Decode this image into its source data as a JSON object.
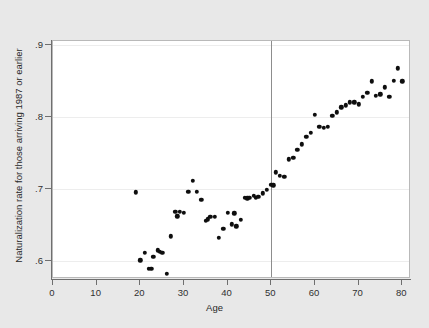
{
  "chart_data": {
    "type": "scatter",
    "title": "",
    "xlabel": "Age",
    "ylabel": "Naturalization rate for those arriving 1987 or earlier",
    "xlim": [
      0,
      82
    ],
    "ylim": [
      0.575,
      0.905
    ],
    "xticks": [
      0,
      10,
      20,
      30,
      40,
      50,
      60,
      70,
      80
    ],
    "xtick_labels": [
      "0",
      "10",
      "20",
      "30",
      "40",
      "50",
      "60",
      "70",
      "80"
    ],
    "yticks": [
      0.6,
      0.7,
      0.8,
      0.9
    ],
    "ytick_labels": [
      ".6",
      ".7",
      ".8",
      ".9"
    ],
    "grid": "horizontal",
    "legend": "none",
    "marker_color": "#0e0e0e",
    "plot_bg": "#ffffff",
    "figure_bg": "#e8e8e8",
    "annotations": [
      {
        "name": "cutoff-line",
        "type": "vertical-line",
        "x": 50,
        "color": "#8d8d8d",
        "label": ""
      }
    ],
    "x": [
      19,
      20,
      21,
      22,
      22.5,
      23,
      24,
      24.5,
      25,
      26,
      27,
      28,
      28.5,
      29,
      30,
      31,
      32,
      33,
      34,
      35,
      35.5,
      36,
      37,
      38,
      39,
      40,
      41,
      41.5,
      42,
      43,
      44,
      44.5,
      45,
      46,
      46.5,
      47,
      48,
      49,
      50,
      50.5,
      51,
      52,
      53,
      54,
      55,
      56,
      57,
      58,
      59,
      60,
      61,
      62,
      63,
      64,
      65,
      66,
      67,
      68,
      69,
      70,
      71,
      72,
      73,
      74,
      75,
      76,
      77,
      78,
      79,
      80
    ],
    "y": [
      0.695,
      0.601,
      0.611,
      0.589,
      0.589,
      0.606,
      0.615,
      0.613,
      0.611,
      0.582,
      0.634,
      0.668,
      0.662,
      0.668,
      0.667,
      0.696,
      0.711,
      0.696,
      0.685,
      0.656,
      0.658,
      0.661,
      0.661,
      0.632,
      0.645,
      0.667,
      0.651,
      0.666,
      0.648,
      0.657,
      0.688,
      0.687,
      0.688,
      0.69,
      0.688,
      0.689,
      0.694,
      0.699,
      0.706,
      0.705,
      0.723,
      0.718,
      0.717,
      0.741,
      0.743,
      0.754,
      0.762,
      0.772,
      0.778,
      0.803,
      0.786,
      0.785,
      0.786,
      0.801,
      0.806,
      0.813,
      0.816,
      0.82,
      0.82,
      0.817,
      0.828,
      0.833,
      0.849,
      0.829,
      0.831,
      0.841,
      0.828,
      0.85,
      0.867,
      0.849
    ]
  }
}
